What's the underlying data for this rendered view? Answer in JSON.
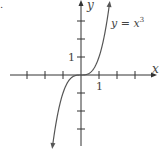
{
  "figure": {
    "corner_mark": ".",
    "curve_label_y": "y = x",
    "curve_label_exp": "3"
  },
  "chart_data": {
    "type": "line",
    "title": "",
    "function": "y = x^3",
    "xlabel": "x",
    "ylabel": "y",
    "tick_labels": {
      "x": [
        "1"
      ],
      "y": [
        "1"
      ]
    },
    "x_ticks": [
      -3,
      -2,
      -1,
      1,
      2,
      3
    ],
    "y_ticks": [
      -3,
      -2,
      -1,
      1,
      2,
      3
    ],
    "xlim": [
      -4,
      4
    ],
    "ylim": [
      -4,
      4
    ],
    "grid": false,
    "series": [
      {
        "name": "y = x^3",
        "x": [
          -1.6,
          -1.4,
          -1.2,
          -1.0,
          -0.8,
          -0.6,
          -0.4,
          -0.2,
          0,
          0.2,
          0.4,
          0.6,
          0.8,
          1.0,
          1.2,
          1.4,
          1.6
        ],
        "values": [
          -4.096,
          -2.744,
          -1.728,
          -1.0,
          -0.512,
          -0.216,
          -0.064,
          -0.008,
          0,
          0.008,
          0.064,
          0.216,
          0.512,
          1.0,
          1.728,
          2.744,
          4.096
        ]
      }
    ],
    "colors": {
      "axes": "#333333",
      "curve": "#555555",
      "text": "#444444"
    }
  }
}
